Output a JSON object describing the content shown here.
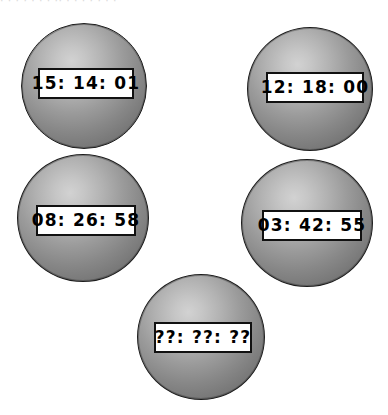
{
  "page": {
    "background_color": "#ffffff",
    "width": 388,
    "height": 415,
    "top_artifact_text": "·  ·   ·  ·  ·   ·    ·  ·· ·  ·   ·  ·  ·   ·  ·"
  },
  "style": {
    "sphere_highlight_color": "#d2d2d2",
    "sphere_mid_color": "#9b9b9b",
    "sphere_edge_color": "#6a6a6a",
    "sphere_outline_color": "#1d1d1d",
    "readout_background_color": "#ffffff",
    "readout_border_color": "#111111",
    "readout_text_color": "#000000"
  },
  "spheres": [
    {
      "id": "sphere-top-left",
      "position": "top-left",
      "readout": "15: 14: 01",
      "hours": "15",
      "minutes": "14",
      "seconds": "01",
      "known": true
    },
    {
      "id": "sphere-top-right",
      "position": "top-right",
      "readout": "12: 18: 00",
      "hours": "12",
      "minutes": "18",
      "seconds": "00",
      "known": true
    },
    {
      "id": "sphere-middle-left",
      "position": "middle-left",
      "readout": "08: 26: 58",
      "hours": "08",
      "minutes": "26",
      "seconds": "58",
      "known": true
    },
    {
      "id": "sphere-middle-right",
      "position": "middle-right",
      "readout": "03: 42: 55",
      "hours": "03",
      "minutes": "42",
      "seconds": "55",
      "known": true
    },
    {
      "id": "sphere-bottom-center",
      "position": "bottom-center",
      "readout": "??: ??: ??",
      "hours": "??",
      "minutes": "??",
      "seconds": "??",
      "known": false
    }
  ]
}
